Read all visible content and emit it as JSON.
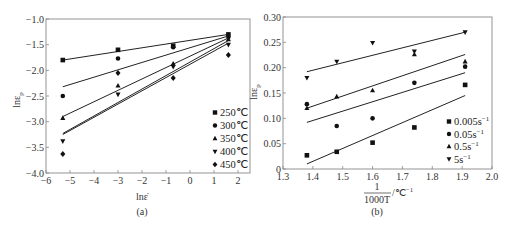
{
  "chart_data": [
    {
      "type": "scatter",
      "panel": "(a)",
      "title": "",
      "xlabel": "lnε̇",
      "ylabel": "lnεp",
      "xlim": [
        -6,
        2.5
      ],
      "ylim": [
        -4.0,
        -1.0
      ],
      "xticks": [
        -6,
        -5,
        -4,
        -3,
        -2,
        -1,
        0,
        1,
        2
      ],
      "xtick_labels": [
        "−6",
        "−5",
        "−4",
        "−3",
        "−2",
        "−1",
        "0",
        "1",
        "2"
      ],
      "yticks": [
        -1.0,
        -1.5,
        -2.0,
        -2.5,
        -3.0,
        -3.5,
        -4.0
      ],
      "ytick_labels": [
        "−1.0",
        "−1.5",
        "−2.0",
        "−2.5",
        "−3.0",
        "−3.5",
        "−4.0"
      ],
      "grid": false,
      "legend_position": "lower right",
      "x": [
        -5.3,
        -3.0,
        -0.7,
        1.6
      ],
      "series": [
        {
          "name": "250℃",
          "marker": "square",
          "values": [
            -1.8,
            -1.6,
            -1.52,
            -1.3
          ],
          "fit": [
            [
              -5.3,
              -1.8
            ],
            [
              1.6,
              -1.3
            ]
          ]
        },
        {
          "name": "300℃",
          "marker": "circle",
          "values": [
            -2.5,
            -1.77,
            -1.55,
            -1.35
          ],
          "fit": [
            [
              -5.3,
              -2.32
            ],
            [
              1.6,
              -1.33
            ]
          ]
        },
        {
          "name": "350℃",
          "marker": "triangle-up",
          "values": [
            -2.93,
            -2.3,
            -1.87,
            -1.4
          ],
          "fit": [
            [
              -5.3,
              -2.9
            ],
            [
              1.6,
              -1.37
            ]
          ]
        },
        {
          "name": "400℃",
          "marker": "triangle-down",
          "values": [
            -3.38,
            -2.47,
            -1.93,
            -1.5
          ],
          "fit": [
            [
              -5.3,
              -3.23
            ],
            [
              1.6,
              -1.42
            ]
          ]
        },
        {
          "name": "450℃",
          "marker": "diamond",
          "values": [
            -3.63,
            -2.05,
            -2.15,
            -1.7
          ],
          "fit": [
            [
              -5.3,
              -3.25
            ],
            [
              1.6,
              -1.47
            ]
          ]
        }
      ]
    },
    {
      "type": "scatter",
      "panel": "(b)",
      "title": "",
      "xlabel": "1/(1000T) /℃⁻¹",
      "ylabel": "lnεp",
      "xlim": [
        1.3,
        2.0
      ],
      "ylim": [
        0,
        0.3
      ],
      "xticks": [
        1.3,
        1.4,
        1.5,
        1.6,
        1.7,
        1.8,
        1.9,
        2.0
      ],
      "xtick_labels": [
        "1.3",
        "1.4",
        "1.5",
        "1.6",
        "1.7",
        "1.8",
        "1.9",
        "2.0"
      ],
      "yticks": [
        0,
        0.05,
        0.1,
        0.15,
        0.2,
        0.25,
        0.3
      ],
      "ytick_labels": [
        "0",
        "0.05",
        "0.10",
        "0.15",
        "0.20",
        "0.25",
        "0.30"
      ],
      "grid": false,
      "legend_position": "lower right",
      "x": [
        1.38,
        1.48,
        1.6,
        1.74,
        1.91
      ],
      "series": [
        {
          "name": "0.005s⁻¹",
          "marker": "square",
          "values": [
            0.027,
            0.034,
            0.052,
            0.082,
            0.166
          ],
          "fit": [
            [
              1.38,
              0.01
            ],
            [
              1.91,
              0.145
            ]
          ]
        },
        {
          "name": "0.05s⁻¹",
          "marker": "circle",
          "values": [
            0.128,
            0.085,
            0.1,
            0.17,
            0.202
          ],
          "fit": [
            [
              1.38,
              0.092
            ],
            [
              1.91,
              0.19
            ]
          ]
        },
        {
          "name": "0.5s⁻¹",
          "marker": "triangle-up",
          "values": [
            0.12,
            0.143,
            0.155,
            0.226,
            0.212
          ],
          "fit": [
            [
              1.38,
              0.12
            ],
            [
              1.91,
              0.226
            ]
          ]
        },
        {
          "name": "5s⁻¹",
          "marker": "triangle-down",
          "values": [
            0.18,
            0.212,
            0.249,
            0.232,
            0.27
          ],
          "fit": [
            [
              1.38,
              0.192
            ],
            [
              1.91,
              0.27
            ]
          ]
        }
      ]
    }
  ],
  "panels": {
    "a": {
      "caption": "(a)",
      "xlabel_main": "lnε̇",
      "ylabel_main": "lnε",
      "ylabel_sub": "p",
      "legend": [
        "250℃",
        "300℃",
        "350℃",
        "400℃",
        "450℃"
      ]
    },
    "b": {
      "caption": "(b)",
      "xlabel_num": "1",
      "xlabel_den": "1000T",
      "xlabel_unit": "/℃",
      "xlabel_exp": "−1",
      "ylabel_main": "lnε",
      "ylabel_sub": "p",
      "legend": [
        {
          "base": "0.005s",
          "exp": "−1"
        },
        {
          "base": "0.05s",
          "exp": "−1"
        },
        {
          "base": "0.5s",
          "exp": "−1"
        },
        {
          "base": "5s",
          "exp": "−1"
        }
      ]
    }
  }
}
